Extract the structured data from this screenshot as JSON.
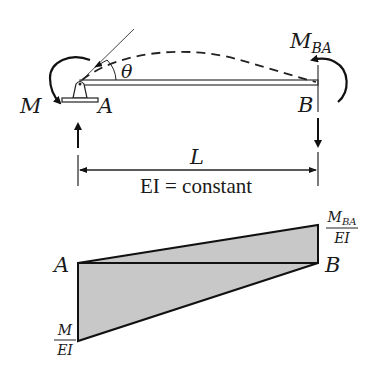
{
  "beam_diagram": {
    "support_a_label": "A",
    "end_b_label": "B",
    "moment_a_label": "M",
    "moment_b_label": "M",
    "moment_b_subscript": "BA",
    "rotation_label": "θ",
    "span_label": "L",
    "stiffness_label": "EI = constant"
  },
  "moment_diagram": {
    "point_a_label": "A",
    "point_b_label": "B",
    "left_numerator": "M",
    "left_denominator": "EI",
    "right_numerator": "M",
    "right_subscript": "BA",
    "right_denominator": "EI",
    "fill_color": "#c8c8c8",
    "stroke_color": "#111111"
  }
}
